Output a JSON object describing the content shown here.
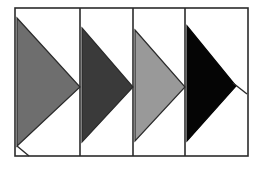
{
  "figure": {
    "title": "Four panel right-pointing triangle figure",
    "canvas": {
      "width": 263,
      "height": 170,
      "background_color": "#ffffff"
    },
    "frame": {
      "x": 15,
      "y": 8,
      "width": 233,
      "height": 148,
      "stroke_color": "#2b2b2b",
      "stroke_width": 1.6,
      "fill_color": "#ffffff"
    },
    "panel_dividers": [
      {
        "name": "divider-1",
        "x": 80,
        "stroke_color": "#2b2b2b",
        "stroke_width": 1.6
      },
      {
        "name": "divider-2",
        "x": 133,
        "stroke_color": "#2b2b2b",
        "stroke_width": 1.6
      },
      {
        "name": "divider-3",
        "x": 185,
        "stroke_color": "#2b2b2b",
        "stroke_width": 1.6
      }
    ],
    "panels": [
      {
        "index": 1,
        "label": "Panel 1",
        "shape": "right-pointing-triangle",
        "fill_color": "#6e6e6e",
        "stroke_color": "#2b2b2b",
        "stroke_width": 1.2,
        "points": "17,18 80,87 17,146",
        "bounds": {
          "left": 17,
          "top": 18,
          "right": 80,
          "bottom": 146
        }
      },
      {
        "index": 2,
        "label": "Panel 2",
        "shape": "right-pointing-triangle",
        "fill_color": "#3a3a3a",
        "stroke_color": "#2b2b2b",
        "stroke_width": 1.2,
        "points": "82,28 133,87 82,142",
        "bounds": {
          "left": 82,
          "top": 28,
          "right": 133,
          "bottom": 142
        }
      },
      {
        "index": 3,
        "label": "Panel 3",
        "shape": "right-pointing-triangle",
        "fill_color": "#999999",
        "stroke_color": "#2b2b2b",
        "stroke_width": 1.2,
        "points": "135,30 185,87 135,141",
        "bounds": {
          "left": 135,
          "top": 30,
          "right": 185,
          "bottom": 141
        }
      },
      {
        "index": 4,
        "label": "Panel 4",
        "shape": "right-pointing-triangle",
        "fill_color": "#050505",
        "stroke_color": "#050505",
        "stroke_width": 1.2,
        "points": "187,26 236,86 187,141",
        "bounds": {
          "left": 187,
          "top": 26,
          "right": 236,
          "bottom": 141
        }
      }
    ],
    "accent_lines": [
      {
        "name": "bottom-left-notch-line",
        "x1": 17,
        "y1": 146,
        "x2": 29,
        "y2": 156,
        "stroke_color": "#2b2b2b",
        "stroke_width": 1.4
      },
      {
        "name": "right-tip-extension-line",
        "x1": 233,
        "y1": 83,
        "x2": 247,
        "y2": 94,
        "stroke_color": "#2b2b2b",
        "stroke_width": 1.4
      }
    ]
  }
}
